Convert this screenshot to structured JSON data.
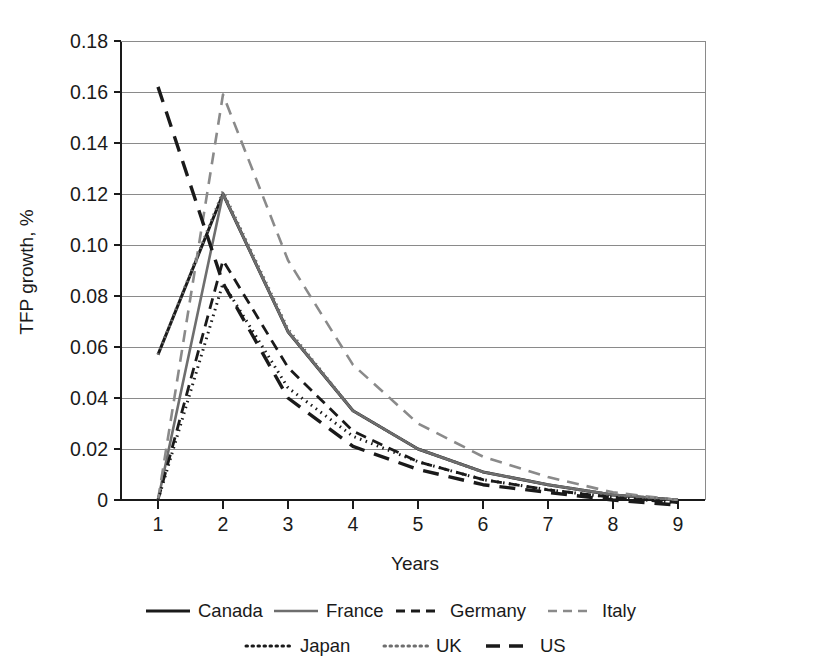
{
  "chart_data": {
    "type": "line",
    "title": "",
    "xlabel": "Years",
    "ylabel": "TFP growth, %",
    "xlim": [
      1,
      9
    ],
    "ylim": [
      0,
      0.18
    ],
    "grid": true,
    "legend_position": "bottom",
    "x": [
      1,
      2,
      3,
      4,
      5,
      6,
      7,
      8,
      9
    ],
    "xticks": [
      "1",
      "2",
      "3",
      "4",
      "5",
      "6",
      "7",
      "8",
      "9"
    ],
    "yticks": [
      "0",
      "0.02",
      "0.04",
      "0.06",
      "0.08",
      "0.10",
      "0.12",
      "0.14",
      "0.16",
      "0.18"
    ],
    "ytick_values": [
      0,
      0.02,
      0.04,
      0.06,
      0.08,
      0.1,
      0.12,
      0.14,
      0.16,
      0.18
    ],
    "series": [
      {
        "name": "Canada",
        "style": "solid",
        "color": "#1a1a1a",
        "width": 3.0,
        "dash": "",
        "values": [
          0.057,
          0.12,
          0.066,
          0.035,
          0.02,
          0.011,
          0.006,
          0.002,
          0.0
        ]
      },
      {
        "name": "France",
        "style": "solid",
        "color": "#6e6e6e",
        "width": 2.6,
        "dash": "",
        "values": [
          0.0,
          0.12,
          0.066,
          0.035,
          0.02,
          0.011,
          0.006,
          0.002,
          0.0
        ]
      },
      {
        "name": "Germany",
        "style": "dashed",
        "color": "#1a1a1a",
        "width": 2.8,
        "dash": "11,7",
        "values": [
          0.0,
          0.094,
          0.052,
          0.027,
          0.015,
          0.008,
          0.004,
          0.001,
          -0.001
        ]
      },
      {
        "name": "Italy",
        "style": "dashed",
        "color": "#8a8a8a",
        "width": 2.6,
        "dash": "12,8",
        "values": [
          0.0,
          0.159,
          0.094,
          0.053,
          0.03,
          0.017,
          0.009,
          0.003,
          0.0
        ]
      },
      {
        "name": "Japan",
        "style": "dotted",
        "color": "#1a1a1a",
        "width": 3.0,
        "dash": "1.5,4.5",
        "values": [
          0.0,
          0.085,
          0.044,
          0.025,
          0.015,
          0.008,
          0.004,
          0.001,
          -0.001
        ]
      },
      {
        "name": "UK",
        "style": "dotted",
        "color": "#6e6e6e",
        "width": 3.0,
        "dash": "1.5,4.5",
        "values": [
          0.057,
          0.121,
          0.067,
          0.035,
          0.02,
          0.011,
          0.006,
          0.002,
          0.0
        ]
      },
      {
        "name": "US",
        "style": "dashed-long",
        "color": "#1a1a1a",
        "width": 3.4,
        "dash": "16,10",
        "values": [
          0.162,
          0.085,
          0.04,
          0.021,
          0.012,
          0.006,
          0.003,
          0.0,
          -0.002
        ]
      }
    ],
    "legend": [
      {
        "label": "Canada",
        "style": "solid",
        "color": "#1a1a1a",
        "width": 3.0,
        "dash": ""
      },
      {
        "label": "France",
        "style": "solid",
        "color": "#6e6e6e",
        "width": 2.6,
        "dash": ""
      },
      {
        "label": "Germany",
        "style": "dashed",
        "color": "#1a1a1a",
        "width": 2.8,
        "dash": "9,6"
      },
      {
        "label": "Italy",
        "style": "dashed",
        "color": "#8a8a8a",
        "width": 2.6,
        "dash": "9,6"
      },
      {
        "label": "Japan",
        "style": "dotted",
        "color": "#1a1a1a",
        "width": 3.0,
        "dash": "1.5,4.5"
      },
      {
        "label": "UK",
        "style": "dotted",
        "color": "#6e6e6e",
        "width": 3.0,
        "dash": "1.5,4.5"
      },
      {
        "label": "US",
        "style": "dashed-long",
        "color": "#1a1a1a",
        "width": 3.4,
        "dash": "14,9"
      }
    ]
  }
}
